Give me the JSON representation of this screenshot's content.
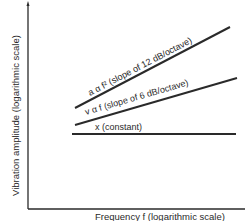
{
  "diagram": {
    "y_axis_label": "Vibration amplitude  (logarithmic scale)",
    "x_axis_label": "Frequency  f  (logarithmic scale)",
    "lines": [
      {
        "id": "acceleration",
        "label": "a α f² (slope of 12 dB/octave)",
        "slope_db_per_octave": 12
      },
      {
        "id": "velocity",
        "label": "v α f  (slope of 6 dB/octave)",
        "slope_db_per_octave": 6
      },
      {
        "id": "displacement",
        "label": "x  (constant)",
        "slope_db_per_octave": 0
      }
    ],
    "colors": {
      "line": "#2a2a2a",
      "background": "#ffffff"
    }
  }
}
